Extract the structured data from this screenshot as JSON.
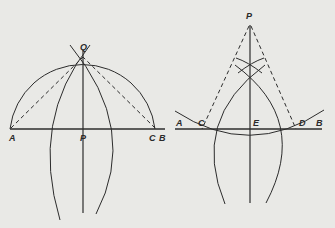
{
  "diagram": {
    "type": "geometric-construction",
    "colors": {
      "background": "#e9e9e6",
      "ink": "#2c2c2c"
    },
    "left_figure": {
      "title": "perpendicular from point P on line AB",
      "labels": {
        "A": "A",
        "P": "P",
        "C": "C",
        "B": "B",
        "Q": "Q"
      }
    },
    "right_figure": {
      "title": "perpendicular from external point P to line AB",
      "labels": {
        "P": "P",
        "A": "A",
        "C": "C",
        "E": "E",
        "D": "D",
        "B": "B"
      }
    }
  }
}
